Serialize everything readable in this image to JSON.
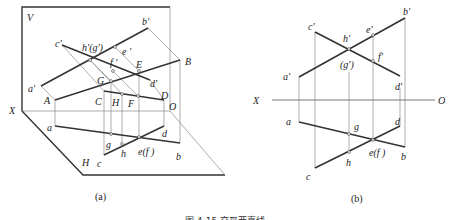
{
  "figure": {
    "caption": "图 4-15  交叉两直线",
    "panel_a": {
      "label": "(a)",
      "plane_labels": {
        "v_plane": "V",
        "h_plane": "H",
        "x_axis": "X",
        "origin": "O"
      },
      "space_points": {
        "A": "A",
        "B": "B",
        "C": "C",
        "D": "D",
        "E": "E",
        "F": "F",
        "G": "G",
        "H": "H"
      },
      "v_projections": {
        "a": "a'",
        "b": "b'",
        "c": "c'",
        "d": "d'",
        "e": "e '",
        "f": "f '",
        "hg": "h'(g')"
      },
      "h_projections": {
        "a": "a",
        "b": "b",
        "c": "c",
        "d": "d",
        "g": "g",
        "h": "h",
        "ef": "e(f )"
      }
    },
    "panel_b": {
      "label": "(b)",
      "axis": {
        "x": "X",
        "o": "O"
      },
      "v_projections": {
        "a": "a'",
        "b": "b'",
        "c": "c'",
        "d": "d'",
        "e": "e'",
        "f": "f'",
        "h": "h'",
        "g": "(g')"
      },
      "h_projections": {
        "a": "a",
        "b": "b",
        "c": "c",
        "d": "d",
        "g": "g",
        "h": "h",
        "ef": "e(f )"
      }
    }
  }
}
